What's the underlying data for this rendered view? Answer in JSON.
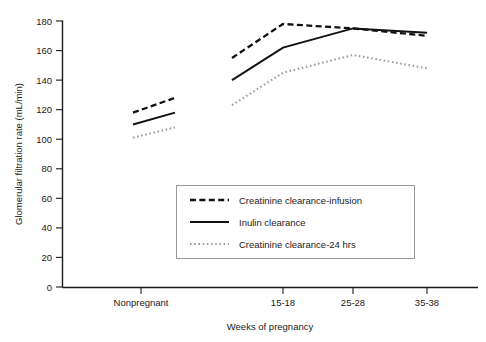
{
  "chart_data": {
    "type": "line",
    "title": "",
    "xlabel": "Weeks of pregnancy",
    "ylabel": "Glomerular filtration rate (mL/min)",
    "ylim": [
      0,
      180
    ],
    "yticks": [
      0,
      20,
      40,
      60,
      80,
      100,
      120,
      140,
      160,
      180
    ],
    "categories": [
      "Nonpregnant",
      "15-18",
      "25-28",
      "35-38"
    ],
    "grid": false,
    "legend_position": "center",
    "note": "Each category is drawn as a short sloped segment; the nonpregnant segment is separated from the pregnancy segments by a gap.",
    "series": [
      {
        "name": "Creatinine clearance-infusion",
        "style": "dashed",
        "color": "#111111",
        "nonpregnant_segment": [
          118,
          128
        ],
        "pregnancy_values": [
          155,
          178,
          175,
          170
        ]
      },
      {
        "name": "Inulin clearance",
        "style": "solid",
        "color": "#111111",
        "nonpregnant_segment": [
          110,
          118
        ],
        "pregnancy_values": [
          140,
          162,
          175,
          172
        ]
      },
      {
        "name": "Creatinine clearance-24 hrs",
        "style": "dotted",
        "color": "#9d9d9d",
        "nonpregnant_segment": [
          101,
          108
        ],
        "pregnancy_values": [
          123,
          145,
          157,
          148
        ]
      }
    ]
  },
  "axes": {
    "y_tick_labels": [
      "180",
      "160",
      "140",
      "120",
      "100",
      "80",
      "60",
      "40",
      "20",
      "0"
    ],
    "y_axis_title": "Glomerular filtration rate (mL/min)",
    "x_tick_labels": [
      "Nonpregnant",
      "15-18",
      "25-28",
      "35-38"
    ],
    "x_axis_title": "Weeks of pregnancy"
  },
  "legend": {
    "entries": [
      {
        "label": "Creatinine clearance-infusion",
        "style": "dashed"
      },
      {
        "label": "Inulin clearance",
        "style": "solid"
      },
      {
        "label": "Creatinine clearance-24 hrs",
        "style": "dotted"
      }
    ]
  }
}
